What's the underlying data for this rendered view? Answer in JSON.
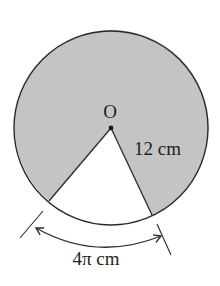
{
  "diagram": {
    "type": "circle-sector",
    "center_label": "O",
    "radius_label": "12 cm",
    "arc_label": "4π cm",
    "colors": {
      "shaded": "#c4c4c4",
      "stroke": "#2a2a2a",
      "background": "#ffffff"
    },
    "geometry": {
      "center": [
        111,
        128
      ],
      "radius": 97,
      "sector_start_point": [
        49,
        201
      ],
      "sector_end_point": [
        152,
        215
      ]
    }
  }
}
